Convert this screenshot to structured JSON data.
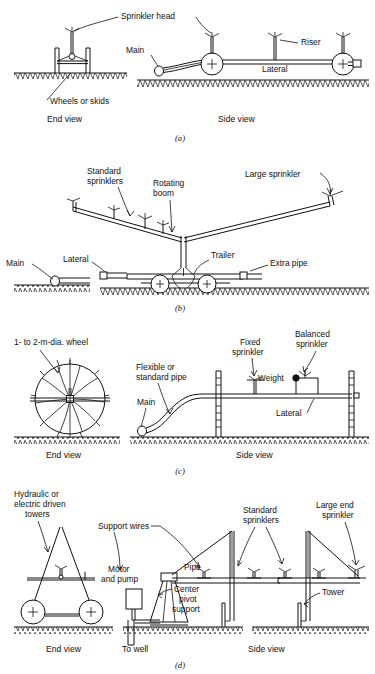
{
  "figure": {
    "panels": [
      {
        "id": "a",
        "caption": "(a)",
        "name": "hand-move-or-side-roll-lateral",
        "views": {
          "left": "End view",
          "right": "Side view"
        },
        "labels": [
          "Sprinkler head",
          "Riser",
          "Main",
          "Lateral",
          "Wheels or skids"
        ]
      },
      {
        "id": "b",
        "caption": "(b)",
        "name": "rotating-boom-trailer-sprinkler",
        "views": {},
        "labels": [
          "Standard sprinklers",
          "Rotating boom",
          "Large sprinkler",
          "Main",
          "Lateral",
          "Trailer",
          "Extra pipe"
        ]
      },
      {
        "id": "c",
        "caption": "(c)",
        "name": "side-roll-wheel-line-lateral",
        "views": {
          "left": "End view",
          "right": "Side view"
        },
        "labels": [
          "1- to 2-m-dia. wheel",
          "Flexible or standard pipe",
          "Fixed sprinkler",
          "Balanced sprinkler",
          "Weight",
          "Main",
          "Lateral"
        ]
      },
      {
        "id": "d",
        "caption": "(d)",
        "name": "center-pivot-system",
        "views": {
          "left": "End view",
          "right": "Side view"
        },
        "labels": [
          "Hydraulic or electric driven towers",
          "Support wires",
          "Standard sprinklers",
          "Large end sprinkler",
          "Motor and pump",
          "Pipe",
          "Center pivot support",
          "Tower",
          "To well"
        ]
      }
    ],
    "text": {
      "sprinkler_head": "Sprinkler head",
      "riser": "Riser",
      "main": "Main",
      "lateral": "Lateral",
      "wheels_or_skids": "Wheels or skids",
      "end_view": "End view",
      "side_view": "Side view",
      "cap_a": "(a)",
      "standard_sprinklers_1": "Standard",
      "standard_sprinklers_2": "sprinklers",
      "rotating_boom_1": "Rotating",
      "rotating_boom_2": "boom",
      "large_sprinkler": "Large sprinkler",
      "trailer": "Trailer",
      "extra_pipe": "Extra pipe",
      "main_b": "Main",
      "lateral_b": "Lateral",
      "cap_b": "(b)",
      "wheel_dia": "1- to 2-m-dia. wheel",
      "flexible_1": "Flexible or",
      "flexible_2": "standard pipe",
      "fixed_1": "Fixed",
      "fixed_2": "sprinkler",
      "balanced_1": "Balanced",
      "balanced_2": "sprinkler",
      "weight": "Weight",
      "main_c": "Main",
      "lateral_c": "Lateral",
      "end_view_c": "End view",
      "side_view_c": "Side view",
      "cap_c": "(c)",
      "hydraulic_1": "Hydraulic or",
      "hydraulic_2": "electric driven",
      "hydraulic_3": "towers",
      "support_wires": "Support wires",
      "std_spr_d1": "Standard",
      "std_spr_d2": "sprinklers",
      "large_end_1": "Large end",
      "large_end_2": "sprinkler",
      "motor_1": "Motor",
      "motor_2": "and pump",
      "pipe": "Pipe",
      "pivot_1": "Center",
      "pivot_2": "pivot",
      "pivot_3": "support",
      "tower": "Tower",
      "to_well": "To well",
      "end_view_d": "End view",
      "side_view_d": "Side view",
      "cap_d": "(d)"
    },
    "colors": {
      "ink": "#111111",
      "paper": "#ffffff"
    }
  }
}
